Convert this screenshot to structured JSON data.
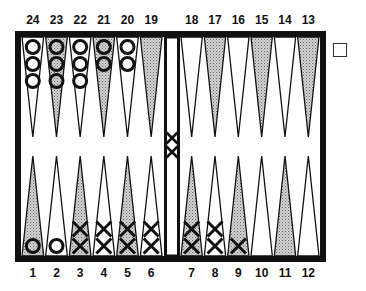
{
  "board": {
    "colors": {
      "frame": "#111111",
      "shaded": "#b8b8b8",
      "light": "#ffffff",
      "checker_stroke": "#111111"
    },
    "top_labels": [
      "24",
      "23",
      "22",
      "21",
      "20",
      "19",
      "18",
      "17",
      "16",
      "15",
      "14",
      "13"
    ],
    "bottom_labels": [
      "1",
      "2",
      "3",
      "4",
      "5",
      "6",
      "7",
      "8",
      "9",
      "10",
      "11",
      "12"
    ],
    "points": {
      "1": {
        "shaded": true,
        "checker": "O",
        "count": 1
      },
      "2": {
        "shaded": false,
        "checker": "O",
        "count": 1
      },
      "3": {
        "shaded": true,
        "checker": "X",
        "count": 2
      },
      "4": {
        "shaded": false,
        "checker": "X",
        "count": 2
      },
      "5": {
        "shaded": true,
        "checker": "X",
        "count": 2
      },
      "6": {
        "shaded": false,
        "checker": "X",
        "count": 2
      },
      "7": {
        "shaded": true,
        "checker": "X",
        "count": 2
      },
      "8": {
        "shaded": false,
        "checker": "X",
        "count": 2
      },
      "9": {
        "shaded": true,
        "checker": "X",
        "count": 1
      },
      "10": {
        "shaded": false,
        "checker": null,
        "count": 0
      },
      "11": {
        "shaded": true,
        "checker": null,
        "count": 0
      },
      "12": {
        "shaded": false,
        "checker": null,
        "count": 0
      },
      "13": {
        "shaded": true,
        "checker": null,
        "count": 0
      },
      "14": {
        "shaded": false,
        "checker": null,
        "count": 0
      },
      "15": {
        "shaded": true,
        "checker": null,
        "count": 0
      },
      "16": {
        "shaded": false,
        "checker": null,
        "count": 0
      },
      "17": {
        "shaded": true,
        "checker": null,
        "count": 0
      },
      "18": {
        "shaded": false,
        "checker": null,
        "count": 0
      },
      "19": {
        "shaded": true,
        "checker": null,
        "count": 0
      },
      "20": {
        "shaded": false,
        "checker": "O",
        "count": 2
      },
      "21": {
        "shaded": true,
        "checker": "O",
        "count": 2
      },
      "22": {
        "shaded": false,
        "checker": "O",
        "count": 3
      },
      "23": {
        "shaded": true,
        "checker": "O",
        "count": 3
      },
      "24": {
        "shaded": false,
        "checker": "O",
        "count": 3
      }
    },
    "bar": {
      "checker": "X",
      "count": 2
    },
    "doubling_cube": {
      "value": ""
    }
  }
}
